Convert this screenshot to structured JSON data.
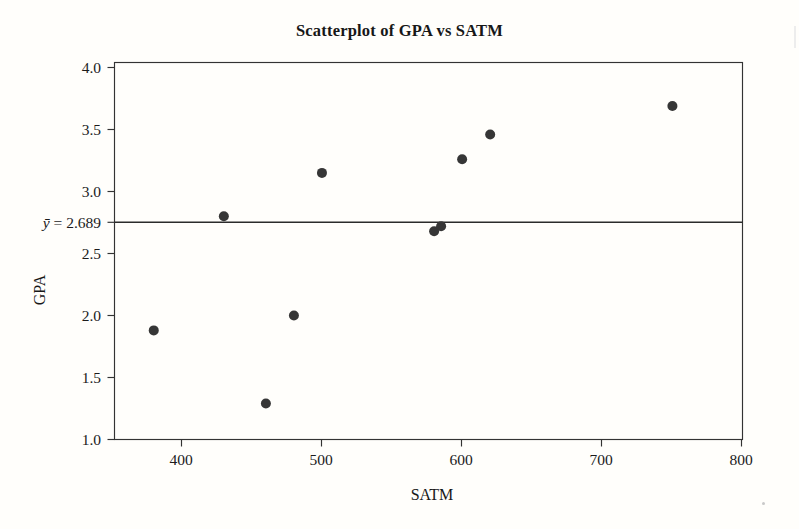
{
  "chart_data": {
    "type": "scatter",
    "title": "Scatterplot of GPA vs SATM",
    "xlabel": "SATM",
    "ylabel": "GPA",
    "xlim": [
      352,
      800
    ],
    "ylim": [
      1.0,
      4.0
    ],
    "xticks": [
      400,
      500,
      600,
      700,
      800
    ],
    "xtick_labels": [
      "400",
      "500",
      "600",
      "700",
      "800"
    ],
    "yticks": [
      1.0,
      1.5,
      2.0,
      2.5,
      3.0,
      3.5,
      4.0
    ],
    "ytick_labels": [
      "1.0",
      "1.5",
      "2.0",
      "2.5",
      "3.0",
      "3.5",
      "4.0"
    ],
    "grid": false,
    "legend": null,
    "x": [
      380,
      430,
      460,
      480,
      500,
      580,
      585,
      600,
      620,
      750
    ],
    "y": [
      1.88,
      2.8,
      1.29,
      2.0,
      3.15,
      2.68,
      2.72,
      3.26,
      3.46,
      3.69
    ],
    "points": [
      {
        "x": 380,
        "y": 1.88
      },
      {
        "x": 430,
        "y": 2.8
      },
      {
        "x": 460,
        "y": 1.29
      },
      {
        "x": 480,
        "y": 2.0
      },
      {
        "x": 500,
        "y": 3.15
      },
      {
        "x": 580,
        "y": 2.68
      },
      {
        "x": 585,
        "y": 2.72
      },
      {
        "x": 600,
        "y": 3.26
      },
      {
        "x": 620,
        "y": 3.46
      },
      {
        "x": 750,
        "y": 3.69
      }
    ],
    "reference_line": {
      "orientation": "horizontal",
      "value": 2.689,
      "label_prefix": "y",
      "label_equals": " = ",
      "label_value": "2.689",
      "label_full": "ȳ = 2.689"
    },
    "marker": {
      "shape": "circle",
      "size_px": 5.2,
      "color": "#363636"
    },
    "colors": {
      "marker": "#363636",
      "axis": "#333333",
      "reference_line": "#2b2b2b",
      "text": "#1b1b1b",
      "background": "#fffefb"
    }
  }
}
